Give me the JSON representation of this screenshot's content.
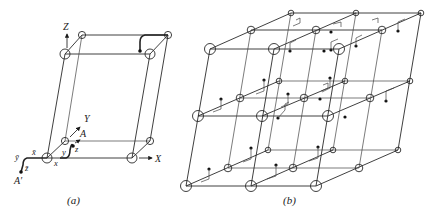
{
  "figure_a": {
    "caption": "(a)",
    "axis_labels": {
      "z_axis": "Z",
      "y_axis": "Y",
      "x_axis": "X"
    },
    "point_labels": {
      "A": "A",
      "A_prime": "A′"
    },
    "coord_labels": {
      "x": "x",
      "y": "y",
      "z": "z",
      "x_bar": "x̄",
      "y_bar": "ȳ",
      "z_bar": "z̄"
    }
  },
  "figure_b": {
    "caption": "(b)"
  }
}
